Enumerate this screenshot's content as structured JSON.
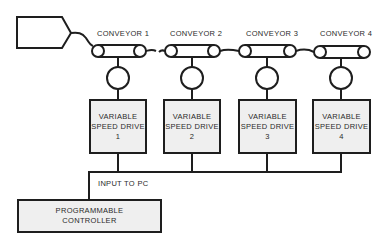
{
  "diagram": {
    "colors": {
      "line": "#1e1e1e",
      "box_fill": "#efefef",
      "text": "#2a2a2a",
      "background": "#ffffff"
    },
    "conveyors": [
      {
        "label": "CONVEYOR 1"
      },
      {
        "label": "CONVEYOR 2"
      },
      {
        "label": "CONVEYOR 3"
      },
      {
        "label": "CONVEYOR 4"
      }
    ],
    "drives": [
      {
        "line1": "VARIABLE",
        "line2": "SPEED DRIVE",
        "number": "1"
      },
      {
        "line1": "VARIABLE",
        "line2": "SPEED DRIVE",
        "number": "2"
      },
      {
        "line1": "VARIABLE",
        "line2": "SPEED DRIVE",
        "number": "3"
      },
      {
        "line1": "VARIABLE",
        "line2": "SPEED DRIVE",
        "number": "4"
      }
    ],
    "bus_label": "INPUT TO PC",
    "controller": {
      "line1": "PROGRAMMABLE",
      "line2": "CONTROLLER"
    }
  }
}
